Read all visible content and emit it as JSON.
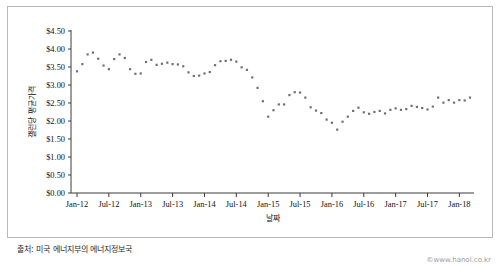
{
  "figure": {
    "source_note": "출처: 미국 에너지부의 에너지정보국",
    "watermark": "©www.hanol.co.kr"
  },
  "chart_data": {
    "type": "scatter",
    "title": "",
    "xlabel": "날짜",
    "ylabel": "갤런당 평균가격",
    "ylim": [
      0.0,
      4.5
    ],
    "ytick_labels": [
      "$0.00",
      "$0.50",
      "$1.00",
      "$1.50",
      "$2.00",
      "$2.50",
      "$3.00",
      "$3.50",
      "$4.00",
      "$4.50"
    ],
    "ytick_values": [
      0.0,
      0.5,
      1.0,
      1.5,
      2.0,
      2.5,
      3.0,
      3.5,
      4.0,
      4.5
    ],
    "xtick_labels": [
      "Jan-12",
      "Jul-12",
      "Jan-13",
      "Jul-13",
      "Jan-14",
      "Jul-14",
      "Jan-15",
      "Jul-15",
      "Jan-16",
      "Jul-16",
      "Jan-17",
      "Jul-17",
      "Jan-18"
    ],
    "xtick_indices": [
      0,
      6,
      12,
      18,
      24,
      30,
      36,
      42,
      48,
      54,
      60,
      66,
      72
    ],
    "grid": false,
    "legend": null,
    "marker": "square-dot",
    "marker_color": "#6f6f78",
    "series": [
      {
        "name": "갤런당 평균가격",
        "x": [
          "Jan-12",
          "Feb-12",
          "Mar-12",
          "Apr-12",
          "May-12",
          "Jun-12",
          "Jul-12",
          "Aug-12",
          "Sep-12",
          "Oct-12",
          "Nov-12",
          "Dec-12",
          "Jan-13",
          "Feb-13",
          "Mar-13",
          "Apr-13",
          "May-13",
          "Jun-13",
          "Jul-13",
          "Aug-13",
          "Sep-13",
          "Oct-13",
          "Nov-13",
          "Dec-13",
          "Jan-14",
          "Feb-14",
          "Mar-14",
          "Apr-14",
          "May-14",
          "Jun-14",
          "Jul-14",
          "Aug-14",
          "Sep-14",
          "Oct-14",
          "Nov-14",
          "Dec-14",
          "Jan-15",
          "Feb-15",
          "Mar-15",
          "Apr-15",
          "May-15",
          "Jun-15",
          "Jul-15",
          "Aug-15",
          "Sep-15",
          "Oct-15",
          "Nov-15",
          "Dec-15",
          "Jan-16",
          "Feb-16",
          "Mar-16",
          "Apr-16",
          "May-16",
          "Jun-16",
          "Jul-16",
          "Aug-16",
          "Sep-16",
          "Oct-16",
          "Nov-16",
          "Dec-16",
          "Jan-17",
          "Feb-17",
          "Mar-17",
          "Apr-17",
          "May-17",
          "Jun-17",
          "Jul-17",
          "Aug-17",
          "Sep-17",
          "Oct-17",
          "Nov-17",
          "Dec-17",
          "Jan-18",
          "Feb-18",
          "Mar-18"
        ],
        "values": [
          3.38,
          3.58,
          3.85,
          3.9,
          3.73,
          3.54,
          3.44,
          3.72,
          3.85,
          3.75,
          3.44,
          3.31,
          3.32,
          3.64,
          3.7,
          3.56,
          3.59,
          3.62,
          3.58,
          3.57,
          3.52,
          3.35,
          3.25,
          3.26,
          3.32,
          3.36,
          3.55,
          3.66,
          3.67,
          3.7,
          3.65,
          3.49,
          3.42,
          3.21,
          2.92,
          2.55,
          2.12,
          2.3,
          2.46,
          2.46,
          2.72,
          2.8,
          2.79,
          2.65,
          2.38,
          2.29,
          2.22,
          2.04,
          1.95,
          1.76,
          1.98,
          2.12,
          2.28,
          2.37,
          2.24,
          2.2,
          2.25,
          2.28,
          2.21,
          2.31,
          2.35,
          2.31,
          2.33,
          2.42,
          2.39,
          2.36,
          2.32,
          2.4,
          2.65,
          2.51,
          2.58,
          2.51,
          2.58,
          2.57,
          2.65
        ]
      }
    ]
  }
}
